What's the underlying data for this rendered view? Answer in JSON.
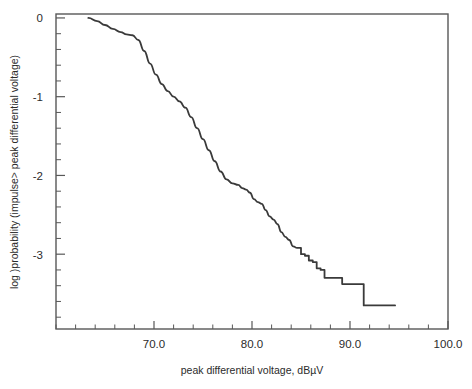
{
  "chart_data": {
    "type": "line",
    "title": "",
    "subtitle": "",
    "xlabel": "peak differential voltage, dBµV",
    "ylabel": "log )probability (impulse> peak differential voltage)",
    "xlim": [
      60.0,
      100.0
    ],
    "ylim": [
      -3.95,
      0.05
    ],
    "grid": false,
    "legend": null,
    "x_ticks_major": [
      70.0,
      80.0,
      90.0,
      100.0
    ],
    "x_tick_labels": [
      "70.0",
      "80.0",
      "90.0",
      "100.0"
    ],
    "x_minor_tick_step": 2.0,
    "y_ticks_major": [
      0,
      -1,
      -2,
      -3
    ],
    "y_tick_labels": [
      "0",
      "-1",
      "-2",
      "-3"
    ],
    "y_minor_tick_step": 0.2,
    "line_color": "#3a3a3a",
    "line_width": 1.8,
    "frame_color": "#585858",
    "series": [
      {
        "name": "impulse exceedance probability",
        "x": [
          63.3,
          64.2,
          65.0,
          65.8,
          66.6,
          67.2,
          67.8,
          68.4,
          69.0,
          69.6,
          70.2,
          70.8,
          71.4,
          72.0,
          72.6,
          73.2,
          73.8,
          74.4,
          75.0,
          75.6,
          76.2,
          76.8,
          77.4,
          78.0,
          78.6,
          79.0,
          79.4,
          79.8,
          80.2,
          80.6,
          81.0,
          81.4,
          81.8,
          82.2,
          82.6,
          83.0,
          83.4,
          83.8,
          84.2,
          84.6,
          85.0,
          85.4,
          85.8,
          86.2,
          86.6,
          87.0,
          87.4,
          88.8,
          89.2,
          91.0,
          91.4,
          94.6
        ],
        "y": [
          0.0,
          -0.04,
          -0.09,
          -0.14,
          -0.18,
          -0.21,
          -0.22,
          -0.28,
          -0.42,
          -0.58,
          -0.72,
          -0.84,
          -0.93,
          -1.0,
          -1.06,
          -1.14,
          -1.26,
          -1.4,
          -1.54,
          -1.68,
          -1.82,
          -1.95,
          -2.05,
          -2.1,
          -2.12,
          -2.16,
          -2.18,
          -2.22,
          -2.3,
          -2.34,
          -2.36,
          -2.44,
          -2.52,
          -2.56,
          -2.62,
          -2.72,
          -2.78,
          -2.82,
          -2.9,
          -2.92,
          -3.0,
          -3.02,
          -3.08,
          -3.1,
          -3.18,
          -3.2,
          -3.3,
          -3.3,
          -3.38,
          -3.38,
          -3.65,
          -3.65
        ]
      }
    ]
  },
  "axis_labels": {
    "x_title": "peak differential voltage, dBµV",
    "y_title": "log )probability (impulse> peak differential voltage)"
  }
}
